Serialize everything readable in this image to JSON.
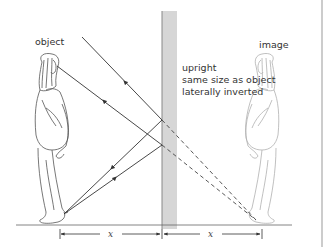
{
  "diagram": {
    "labels": {
      "object": "object",
      "image": "image"
    },
    "image_properties": [
      "upright",
      "same size as object",
      "laterally inverted"
    ],
    "distance_labels": {
      "object_to_mirror": "x",
      "mirror_to_image": "x"
    },
    "colors": {
      "mirror_fill": "#d6d6d6",
      "mirror_edge": "#888888",
      "ray": "#333333",
      "virtual_ray": "#444444",
      "object_figure": "#555555",
      "image_figure": "#aaaaaa",
      "frame": "#999999"
    }
  }
}
